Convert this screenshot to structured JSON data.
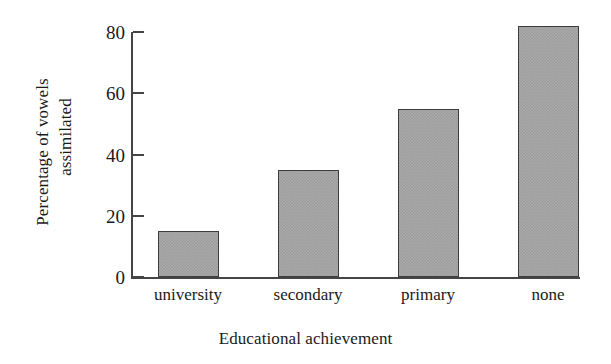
{
  "chart_data": {
    "type": "bar",
    "title": "",
    "subtitle": "",
    "categories": [
      "university",
      "secondary",
      "primary",
      "none"
    ],
    "values": [
      15,
      35,
      55,
      82
    ],
    "series": [
      {
        "name": "Percentage of vowels assimilated",
        "values": [
          15,
          35,
          55,
          82
        ]
      }
    ],
    "xlabel": "Educational achievement",
    "ylabel": "Percentage of vowels assimilated",
    "ylabel_lines": [
      "Percentage of vowels",
      "assimilated"
    ],
    "ylim": [
      0,
      80
    ],
    "yticks": [
      0,
      20,
      40,
      60,
      80
    ],
    "ytick_labels": [
      "0",
      "20",
      "40",
      "60",
      "80"
    ],
    "grid": false,
    "legend": false,
    "legend_position": "none",
    "bar_fill_color": "#a9a9a9",
    "bar_edge_color": "#3d3d3d",
    "axis_color": "#454545",
    "background_color": "#ffffff",
    "tick_direction": "in"
  }
}
